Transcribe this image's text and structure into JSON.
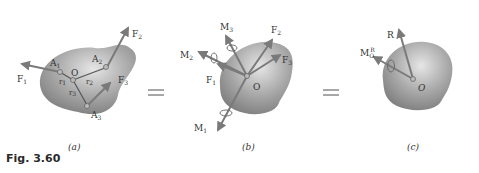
{
  "figure": {
    "caption": "Fig. 3.60",
    "panels": [
      {
        "id": "a",
        "label": "(a)"
      },
      {
        "id": "b",
        "label": "(b)"
      },
      {
        "id": "c",
        "label": "(c)"
      }
    ],
    "panel_a": {
      "origin": "O",
      "points": [
        "A1",
        "A2",
        "A3"
      ],
      "forces": [
        "F1",
        "F2",
        "F3"
      ],
      "position_vectors": [
        "r1",
        "r2",
        "r3"
      ]
    },
    "panel_b": {
      "origin": "O",
      "forces": [
        "F1",
        "F2",
        "F3"
      ],
      "moments": [
        "M1",
        "M2",
        "M3"
      ]
    },
    "panel_c": {
      "origin": "O",
      "resultant": "R",
      "moment": "M",
      "moment_sub": "O",
      "moment_sup": "R"
    },
    "equals_sign": "="
  },
  "colors": {
    "body": "#8e8e8e",
    "arrow": "#7a7a7a",
    "text": "#333333"
  }
}
